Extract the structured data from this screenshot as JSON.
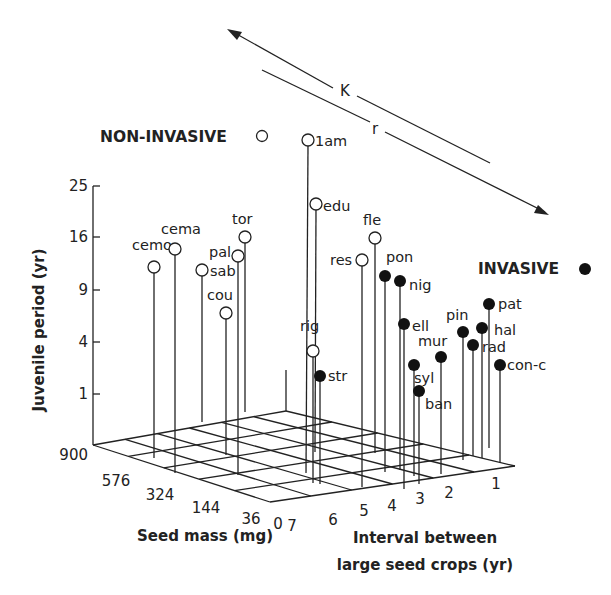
{
  "chart_data": {
    "type": "3d-stem-scatter",
    "title": "",
    "axes": {
      "z": {
        "label": "Juvenile period (yr)",
        "ticks": [
          "25",
          "16",
          "9",
          "4",
          "1"
        ],
        "scale": "square-root"
      },
      "x": {
        "label": "Seed mass (mg)",
        "ticks": [
          "900",
          "576",
          "324",
          "144",
          "36",
          "0"
        ],
        "scale": "square-root"
      },
      "y": {
        "label": "Interval between large seed crops (yr)",
        "ticks": [
          "7",
          "6",
          "5",
          "4",
          "3",
          "2",
          "1"
        ]
      }
    },
    "legend": [
      {
        "label": "NON-INVASIVE",
        "marker": "open-circle"
      },
      {
        "label": "INVASIVE",
        "marker": "filled-circle"
      }
    ],
    "annotations": {
      "gradient_arrow": {
        "labels": [
          "K",
          "r"
        ],
        "direction": "K toward non-invasive (upper-left), r toward invasive (lower-right)"
      }
    },
    "series": [
      {
        "name": "NON-INVASIVE",
        "marker": "open",
        "points": [
          {
            "label": "cemo",
            "cx": 154,
            "cy": 267,
            "bx": 154,
            "by": 458,
            "lx": 132,
            "ly": 250,
            "anchor": "start"
          },
          {
            "label": "cema",
            "cx": 175,
            "cy": 249,
            "bx": 175,
            "by": 473,
            "lx": 161,
            "ly": 234,
            "anchor": "start"
          },
          {
            "label": "sab",
            "cx": 202,
            "cy": 270,
            "bx": 202,
            "by": 422,
            "lx": 210,
            "ly": 276,
            "anchor": "start"
          },
          {
            "label": "pal",
            "cx": 238,
            "cy": 256,
            "bx": 238,
            "by": 475,
            "lx": 209,
            "ly": 257,
            "anchor": "start"
          },
          {
            "label": "tor",
            "cx": 245,
            "cy": 237,
            "bx": 245,
            "by": 412,
            "lx": 232,
            "ly": 224,
            "anchor": "start"
          },
          {
            "label": "cou",
            "cx": 226,
            "cy": 313,
            "bx": 226,
            "by": 455,
            "lx": 207,
            "ly": 300,
            "anchor": "start"
          },
          {
            "label": "1am",
            "cx": 308,
            "cy": 140,
            "bx": 306,
            "by": 473,
            "lx": 315,
            "ly": 146,
            "anchor": "start"
          },
          {
            "label": "edu",
            "cx": 316,
            "cy": 204,
            "bx": 315,
            "by": 452,
            "lx": 323,
            "ly": 211,
            "anchor": "start"
          },
          {
            "label": "rig",
            "cx": 313,
            "cy": 351,
            "bx": 313,
            "by": 483,
            "lx": 300,
            "ly": 331,
            "anchor": "start"
          },
          {
            "label": "res",
            "cx": 362,
            "cy": 260,
            "bx": 362,
            "by": 487,
            "lx": 330,
            "ly": 265,
            "anchor": "start"
          },
          {
            "label": "fle",
            "cx": 375,
            "cy": 238,
            "bx": 375,
            "by": 453,
            "lx": 363,
            "ly": 225,
            "anchor": "start"
          }
        ]
      },
      {
        "name": "INVASIVE",
        "marker": "filled",
        "points": [
          {
            "label": "str",
            "cx": 320,
            "cy": 376,
            "bx": 320,
            "by": 484,
            "lx": 328,
            "ly": 381,
            "anchor": "start"
          },
          {
            "label": "pon",
            "cx": 385,
            "cy": 276,
            "bx": 385,
            "by": 472,
            "lx": 386,
            "ly": 262,
            "anchor": "start"
          },
          {
            "label": "nig",
            "cx": 400,
            "cy": 281,
            "bx": 400,
            "by": 470,
            "lx": 409,
            "ly": 290,
            "anchor": "start"
          },
          {
            "label": "ell",
            "cx": 404,
            "cy": 324,
            "bx": 404,
            "by": 489,
            "lx": 412,
            "ly": 331,
            "anchor": "start"
          },
          {
            "label": "syl",
            "cx": 414,
            "cy": 365,
            "bx": 414,
            "by": 476,
            "lx": 414,
            "ly": 383,
            "anchor": "start"
          },
          {
            "label": "ban",
            "cx": 419,
            "cy": 391,
            "bx": 419,
            "by": 484,
            "lx": 425,
            "ly": 409,
            "anchor": "start"
          },
          {
            "label": "mur",
            "cx": 441,
            "cy": 357,
            "bx": 441,
            "by": 474,
            "lx": 418,
            "ly": 346,
            "anchor": "start"
          },
          {
            "label": "pin",
            "cx": 463,
            "cy": 332,
            "bx": 463,
            "by": 460,
            "lx": 446,
            "ly": 320,
            "anchor": "start"
          },
          {
            "label": "rad",
            "cx": 473,
            "cy": 345,
            "bx": 473,
            "by": 456,
            "lx": 482,
            "ly": 352,
            "anchor": "start"
          },
          {
            "label": "hal",
            "cx": 482,
            "cy": 328,
            "bx": 482,
            "by": 458,
            "lx": 494,
            "ly": 335,
            "anchor": "start"
          },
          {
            "label": "pat",
            "cx": 489,
            "cy": 304,
            "bx": 489,
            "by": 448,
            "lx": 498,
            "ly": 309,
            "anchor": "start"
          },
          {
            "label": "con-c",
            "cx": 500,
            "cy": 365,
            "bx": 500,
            "by": 463,
            "lx": 507,
            "ly": 370,
            "anchor": "start"
          }
        ]
      }
    ]
  },
  "labels": {
    "z_axis_title": "Juvenile period (yr)",
    "x_axis_title": "Seed mass (mg)",
    "y_axis_title_line1": "Interval between",
    "y_axis_title_line2": "large seed crops (yr)",
    "legend_noninvasive": "NON-INVASIVE",
    "legend_invasive": "INVASIVE",
    "arrow_k": "K",
    "arrow_r": "r"
  }
}
